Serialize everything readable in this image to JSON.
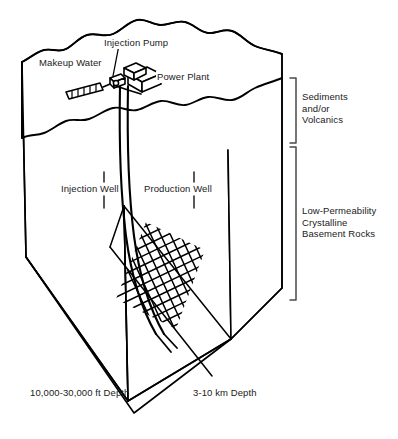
{
  "figure": {
    "type": "geothermal-block-diagram",
    "background_color": "#ffffff",
    "line_color": "#000000",
    "text_color": "#1a1a1a"
  },
  "surface_labels": {
    "makeup_water": "Makeup Water",
    "injection_pump": "Injection Pump",
    "power_plant": "Power Plant"
  },
  "well_labels": {
    "injection_well": "Injection Well",
    "production_well": "Production Well"
  },
  "strata": [
    {
      "id": "sediments",
      "label": "Sediments\nand/or\nVolcanics",
      "bracket_top": 78,
      "bracket_bottom": 143
    },
    {
      "id": "basement",
      "label": "Low-Permeability\nCrystalline\nBasement Rocks",
      "bracket_top": 147,
      "bracket_bottom": 300
    }
  ],
  "depth_labels": {
    "imperial": "10,000-30,000 ft Depth",
    "metric": "3-10 km Depth"
  },
  "features": {
    "fracture_zone": "cross-hatched stimulated reservoir",
    "makeup_water_pipe": "hatched intake pipe",
    "ground_surface": "irregular wavy terrain"
  }
}
